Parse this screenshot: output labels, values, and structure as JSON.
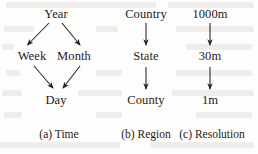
{
  "figure": {
    "background_color": "#fdfdfc",
    "ink_color": "#1d1b1b"
  },
  "panels": [
    {
      "id": "time",
      "caption": "(a) Time",
      "nodes": [
        {
          "id": "year",
          "label": "Year"
        },
        {
          "id": "week",
          "label": "Week"
        },
        {
          "id": "month",
          "label": "Month"
        },
        {
          "id": "day",
          "label": "Day"
        }
      ],
      "edges": [
        {
          "from": "year",
          "to": "week"
        },
        {
          "from": "year",
          "to": "month"
        },
        {
          "from": "week",
          "to": "day"
        },
        {
          "from": "month",
          "to": "day"
        }
      ]
    },
    {
      "id": "region",
      "caption": "(b) Region",
      "nodes": [
        {
          "id": "country",
          "label": "Country"
        },
        {
          "id": "state",
          "label": "State"
        },
        {
          "id": "county",
          "label": "County"
        }
      ],
      "edges": [
        {
          "from": "country",
          "to": "state"
        },
        {
          "from": "state",
          "to": "county"
        }
      ]
    },
    {
      "id": "resolution",
      "caption": "(c) Resolution",
      "nodes": [
        {
          "id": "r1000",
          "label": "1000m"
        },
        {
          "id": "r30",
          "label": "30m"
        },
        {
          "id": "r1",
          "label": "1m"
        }
      ],
      "edges": [
        {
          "from": "r1000",
          "to": "r30"
        },
        {
          "from": "r30",
          "to": "r1"
        }
      ]
    }
  ]
}
